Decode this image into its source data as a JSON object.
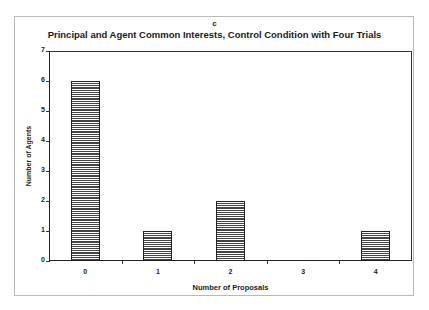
{
  "chart_data": {
    "type": "bar",
    "panel_label": "c",
    "title": "Principal and Agent Common Interests, Control Condition with Four Trials",
    "xlabel": "Number of Proposals",
    "ylabel": "Number of Agents",
    "categories": [
      "0",
      "1",
      "2",
      "3",
      "4"
    ],
    "values": [
      6,
      1,
      2,
      0,
      1
    ],
    "ylim": [
      0,
      7
    ],
    "yticks": [
      "0",
      "1",
      "2",
      "3",
      "4",
      "5",
      "6",
      "7"
    ],
    "grid": false,
    "legend": null,
    "bar_fill": "horizontal-hatch",
    "colors": {
      "bar_stroke": "#222222",
      "hatch": "#444444",
      "axis": "#222222"
    }
  }
}
